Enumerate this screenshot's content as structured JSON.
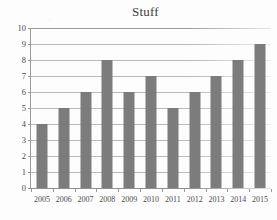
{
  "chart_data": {
    "type": "bar",
    "title": "Stuff",
    "xlabel": "",
    "ylabel": "",
    "categories": [
      "2005",
      "2006",
      "2007",
      "2008",
      "2009",
      "2010",
      "2011",
      "2012",
      "2013",
      "2014",
      "2015"
    ],
    "values": [
      4,
      5,
      6,
      8,
      6,
      7,
      5,
      6,
      7,
      8,
      9
    ],
    "ylim": [
      0,
      10
    ],
    "ytick_labels": [
      "0",
      "1",
      "2",
      "3",
      "4",
      "5",
      "6",
      "7",
      "8",
      "9",
      "10"
    ],
    "ytick_values": [
      0,
      1,
      2,
      3,
      4,
      5,
      6,
      7,
      8,
      9,
      10
    ],
    "grid": true,
    "grid_axis": "y",
    "legend": false,
    "legend_position": "none",
    "bar_color": "#7c7c7c",
    "grid_color": "#b9b9b9",
    "axis_color": "#9a9a9a",
    "text_color": "#4a4a4a",
    "background_color": "#fdfdfd"
  }
}
